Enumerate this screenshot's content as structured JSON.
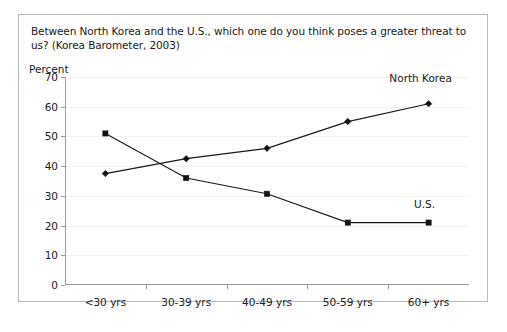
{
  "chart_data": {
    "type": "line",
    "title": "Between North Korea and the U.S., which one do you think poses a greater threat to us? (Korea Barometer, 2003)",
    "xlabel": "",
    "ylabel": "Percent",
    "categories": [
      "<30 yrs",
      "30-39 yrs",
      "40-49 yrs",
      "50-59 yrs",
      "60+ yrs"
    ],
    "ylim": [
      0,
      70
    ],
    "yticks": [
      0,
      10,
      20,
      30,
      40,
      50,
      60,
      70
    ],
    "grid": true,
    "legend_position": "inline-annotation",
    "series": [
      {
        "name": "North Korea",
        "marker": "diamond",
        "values": [
          37.5,
          42.5,
          46.0,
          55.0,
          61.0
        ],
        "annotation": "North Korea"
      },
      {
        "name": "U.S.",
        "marker": "square",
        "values": [
          51.0,
          36.0,
          30.7,
          21.0,
          21.0
        ],
        "annotation": "U.S."
      }
    ],
    "colors": {
      "line": "#1a1a1a",
      "axis": "#9a9a9a",
      "grid": "#f2f2f2",
      "border": "#b9b9b9",
      "text": "#202020"
    }
  }
}
